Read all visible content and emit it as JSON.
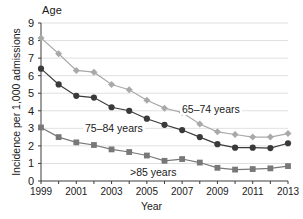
{
  "chart_data": {
    "type": "line",
    "title": "",
    "top_label": "Age",
    "xlabel": "Year",
    "ylabel": "Incidence per 1,000 admissions",
    "x": [
      1999,
      2000,
      2001,
      2002,
      2003,
      2004,
      2005,
      2006,
      2007,
      2008,
      2009,
      2010,
      2011,
      2012,
      2013
    ],
    "xtick_labels": [
      "1999",
      "2001",
      "2003",
      "2005",
      "2007",
      "2009",
      "2011",
      "2013"
    ],
    "xtick_values": [
      1999,
      2001,
      2003,
      2005,
      2007,
      2009,
      2011,
      2013
    ],
    "ytick_labels": [
      "0",
      "1",
      "2",
      "3",
      "4",
      "5",
      "6",
      "7",
      "8",
      "9"
    ],
    "xlim": [
      1999,
      2013
    ],
    "ylim": [
      0,
      9
    ],
    "grid": "horizontal",
    "legend_position": "inline-annotations",
    "series": [
      {
        "name": "65-74 years",
        "label": "65–74 years",
        "marker": "diamond",
        "color": "#a9a9a9",
        "values": [
          8.15,
          7.25,
          6.3,
          6.2,
          5.5,
          5.2,
          4.6,
          4.15,
          3.9,
          3.25,
          2.8,
          2.65,
          2.5,
          2.5,
          2.7
        ]
      },
      {
        "name": "75-84 years",
        "label": "75–84 years",
        "marker": "circle",
        "color": "#3a3a3a",
        "values": [
          6.4,
          5.5,
          4.85,
          4.75,
          4.2,
          4.0,
          3.55,
          3.2,
          2.9,
          2.5,
          2.1,
          1.9,
          1.9,
          1.875,
          2.15
        ]
      },
      {
        "name": ">85 years",
        "label": ">85 years",
        "marker": "square",
        "color": "#787878",
        "values": [
          3.05,
          2.5,
          2.2,
          2.05,
          1.8,
          1.65,
          1.45,
          1.15,
          1.25,
          1.05,
          0.75,
          0.65,
          0.68,
          0.72,
          0.85
        ]
      }
    ],
    "annotations": [
      {
        "text": "65–74 years",
        "series": "65-74 years"
      },
      {
        "text": "75–84 years",
        "series": "75-84 years"
      },
      {
        "text": ">85 years",
        "series": ">85 years"
      }
    ]
  }
}
